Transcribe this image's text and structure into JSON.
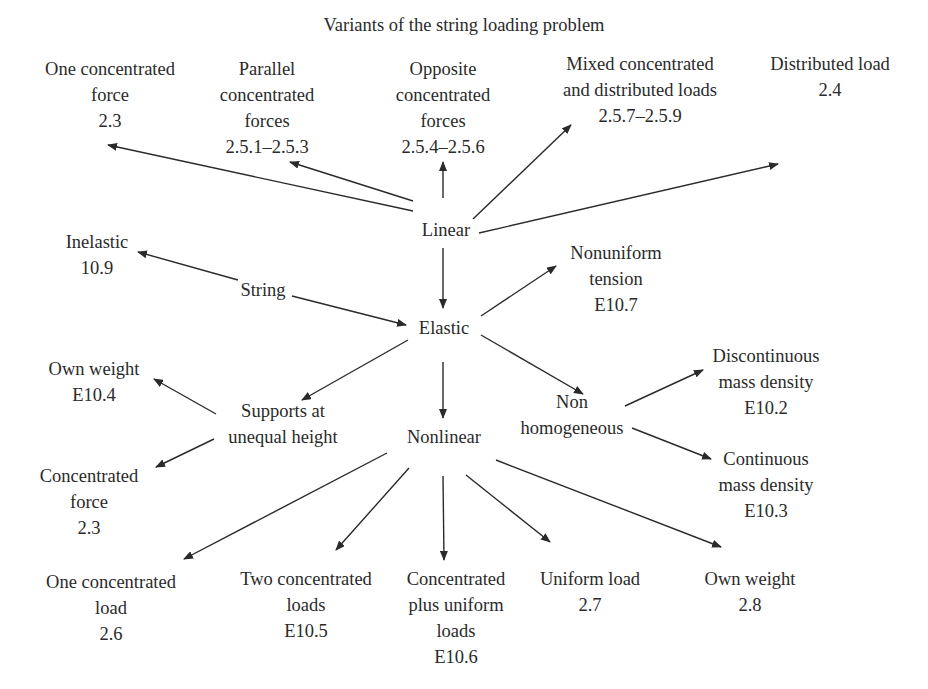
{
  "title": "Variants of the string loading problem",
  "style": {
    "ink_color": "#2a2a2a",
    "background": "#ffffff"
  },
  "nodes": {
    "one_concentrated_force": {
      "lines": [
        "One concentrated",
        "force",
        "2.3"
      ],
      "x": 110,
      "y": 56
    },
    "parallel_concentrated_forces": {
      "lines": [
        "Parallel",
        "concentrated",
        "forces",
        "2.5.1–2.5.3"
      ],
      "x": 267,
      "y": 56
    },
    "opposite_concentrated_forces": {
      "lines": [
        "Opposite",
        "concentrated",
        "forces",
        "2.5.4–2.5.6"
      ],
      "x": 443,
      "y": 56
    },
    "mixed_loads": {
      "lines": [
        "Mixed concentrated",
        "and distributed loads",
        "2.5.7–2.5.9"
      ],
      "x": 640,
      "y": 51
    },
    "distributed_load": {
      "lines": [
        "Distributed load",
        "2.4"
      ],
      "x": 830,
      "y": 51
    },
    "linear": {
      "lines": [
        "Linear"
      ],
      "x": 446,
      "y": 217
    },
    "inelastic": {
      "lines": [
        "Inelastic",
        "10.9"
      ],
      "x": 97,
      "y": 229
    },
    "string": {
      "lines": [
        "String"
      ],
      "x": 263,
      "y": 277
    },
    "nonuniform_tension": {
      "lines": [
        "Nonuniform",
        "tension",
        "E10.7"
      ],
      "x": 616,
      "y": 240
    },
    "elastic": {
      "lines": [
        "Elastic"
      ],
      "x": 444,
      "y": 315
    },
    "own_weight_e104": {
      "lines": [
        "Own weight",
        "E10.4"
      ],
      "x": 94,
      "y": 356
    },
    "supports_unequal_height": {
      "lines": [
        "Supports at",
        "unequal height"
      ],
      "x": 283,
      "y": 398
    },
    "discontinuous_mass_density": {
      "lines": [
        "Discontinuous",
        "mass density",
        "E10.2"
      ],
      "x": 766,
      "y": 343
    },
    "non_homogeneous": {
      "lines": [
        "Non",
        "homogeneous"
      ],
      "x": 572,
      "y": 389
    },
    "nonlinear": {
      "lines": [
        "Nonlinear"
      ],
      "x": 444,
      "y": 424
    },
    "continuous_mass_density": {
      "lines": [
        "Continuous",
        "mass density",
        "E10.3"
      ],
      "x": 766,
      "y": 446
    },
    "concentrated_force_23": {
      "lines": [
        "Concentrated",
        "force",
        "2.3"
      ],
      "x": 89,
      "y": 463
    },
    "one_concentrated_load": {
      "lines": [
        "One concentrated",
        "load",
        "2.6"
      ],
      "x": 111,
      "y": 569
    },
    "two_concentrated_loads": {
      "lines": [
        "Two concentrated",
        "loads",
        "E10.5"
      ],
      "x": 306,
      "y": 566
    },
    "concentrated_plus_uniform": {
      "lines": [
        "Concentrated",
        "plus uniform",
        "loads",
        "E10.6"
      ],
      "x": 456,
      "y": 566
    },
    "uniform_load": {
      "lines": [
        "Uniform load",
        "2.7"
      ],
      "x": 590,
      "y": 566
    },
    "own_weight_28": {
      "lines": [
        "Own weight",
        "2.8"
      ],
      "x": 750,
      "y": 566
    }
  },
  "edges": [
    {
      "from": "linear",
      "to": "one_concentrated_force",
      "x1": 413,
      "y1": 211,
      "x2": 108,
      "y2": 145
    },
    {
      "from": "linear",
      "to": "parallel_concentrated_forces",
      "x1": 413,
      "y1": 201,
      "x2": 290,
      "y2": 162
    },
    {
      "from": "linear",
      "to": "opposite_concentrated_forces",
      "x1": 443,
      "y1": 198,
      "x2": 443,
      "y2": 162
    },
    {
      "from": "linear",
      "to": "mixed_loads",
      "x1": 473,
      "y1": 219,
      "x2": 571,
      "y2": 125
    },
    {
      "from": "linear",
      "to": "distributed_load",
      "x1": 479,
      "y1": 233,
      "x2": 778,
      "y2": 164
    },
    {
      "from": "linear",
      "to": "elastic",
      "x1": 443,
      "y1": 248,
      "x2": 443,
      "y2": 308
    },
    {
      "from": "string",
      "to": "inelastic",
      "x1": 238,
      "y1": 280,
      "x2": 138,
      "y2": 252
    },
    {
      "from": "string",
      "to": "elastic",
      "x1": 292,
      "y1": 296,
      "x2": 406,
      "y2": 325
    },
    {
      "from": "elastic",
      "to": "nonuniform_tension",
      "x1": 481,
      "y1": 316,
      "x2": 556,
      "y2": 266
    },
    {
      "from": "elastic",
      "to": "supports_unequal_height",
      "x1": 408,
      "y1": 340,
      "x2": 302,
      "y2": 400
    },
    {
      "from": "elastic",
      "to": "nonlinear",
      "x1": 443,
      "y1": 362,
      "x2": 443,
      "y2": 418
    },
    {
      "from": "elastic",
      "to": "non_homogeneous",
      "x1": 481,
      "y1": 335,
      "x2": 583,
      "y2": 394
    },
    {
      "from": "supports_unequal_height",
      "to": "own_weight_e104",
      "x1": 216,
      "y1": 414,
      "x2": 154,
      "y2": 379
    },
    {
      "from": "supports_unequal_height",
      "to": "concentrated_force_23",
      "x1": 214,
      "y1": 439,
      "x2": 156,
      "y2": 467
    },
    {
      "from": "non_homogeneous",
      "to": "discontinuous_mass_density",
      "x1": 625,
      "y1": 406,
      "x2": 703,
      "y2": 370
    },
    {
      "from": "non_homogeneous",
      "to": "continuous_mass_density",
      "x1": 632,
      "y1": 428,
      "x2": 711,
      "y2": 459
    },
    {
      "from": "nonlinear",
      "to": "one_concentrated_load",
      "x1": 387,
      "y1": 453,
      "x2": 184,
      "y2": 559
    },
    {
      "from": "nonlinear",
      "to": "two_concentrated_loads",
      "x1": 409,
      "y1": 468,
      "x2": 336,
      "y2": 550
    },
    {
      "from": "nonlinear",
      "to": "concentrated_plus_uniform",
      "x1": 443,
      "y1": 476,
      "x2": 444,
      "y2": 560
    },
    {
      "from": "nonlinear",
      "to": "uniform_load",
      "x1": 466,
      "y1": 475,
      "x2": 550,
      "y2": 542
    },
    {
      "from": "nonlinear",
      "to": "own_weight_28",
      "x1": 496,
      "y1": 460,
      "x2": 721,
      "y2": 547
    }
  ]
}
